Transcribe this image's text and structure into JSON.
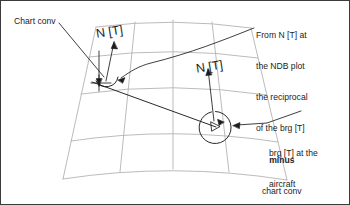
{
  "figure": {
    "kind": "lambert-chart-convergence-diagram",
    "background_color": "#ffffff",
    "border_color": "#3b3b3b",
    "grid_color": "#b3b3b3",
    "ink_color": "#1c1c1c",
    "text_color": "#1c1c1c"
  },
  "labels": {
    "chart_conv": "Chart conv",
    "north_left": "N [T]",
    "north_right": "N [T]"
  },
  "callout_ndb": {
    "lines": [
      "From N [T] at",
      "the NDB plot",
      "the reciprocal",
      "of the brg [T]",
      "minus",
      "chart conv"
    ],
    "bold_line": "minus"
  },
  "callout_bearing": {
    "lines": [
      "brg [T] at the",
      "aircraft"
    ]
  }
}
